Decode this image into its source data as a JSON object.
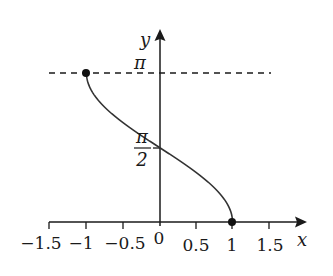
{
  "chart_data": {
    "type": "line",
    "title": "",
    "function": "y = arccos(x)",
    "xlabel": "x",
    "ylabel": "y",
    "xlim": [
      -1.5,
      1.75
    ],
    "ylim": [
      0,
      3.3
    ],
    "grid": false,
    "legend": null,
    "x_ticks": [
      -1.5,
      -1,
      -0.5,
      0,
      0.5,
      1,
      1.5
    ],
    "x_tick_labels": [
      "−1.5",
      "−1",
      "−0.5",
      "0",
      "0.5",
      "1",
      "1.5"
    ],
    "y_ticks": [
      1.5708,
      3.1416
    ],
    "y_tick_labels": [
      "π/2",
      "π"
    ],
    "series": [
      {
        "name": "arccos(x)",
        "x": [
          -1,
          -0.9,
          -0.75,
          -0.5,
          -0.25,
          0,
          0.25,
          0.5,
          0.75,
          0.9,
          1
        ],
        "values": [
          3.1416,
          2.6906,
          2.4189,
          2.0944,
          1.8235,
          1.5708,
          1.3181,
          1.0472,
          0.7227,
          0.451,
          0
        ]
      }
    ],
    "points": [
      {
        "x": -1,
        "y": 3.1416,
        "label": "(-1, π)"
      },
      {
        "x": 1,
        "y": 0,
        "label": "(1, 0)"
      }
    ],
    "annotations": [
      {
        "type": "dashed-horizontal-line",
        "y": 3.1416,
        "x_from": -1.5,
        "x_to": 1.5
      }
    ],
    "colors": {
      "stroke": "#1a1a1a",
      "background": "#ffffff"
    }
  },
  "labels": {
    "x_axis": "x",
    "y_axis": "y",
    "pi": "π",
    "pi_half_num": "π",
    "pi_half_den": "2",
    "ticks": [
      "−1.5",
      "−1",
      "−0.5",
      "0",
      "0.5",
      "1",
      "1.5"
    ]
  }
}
